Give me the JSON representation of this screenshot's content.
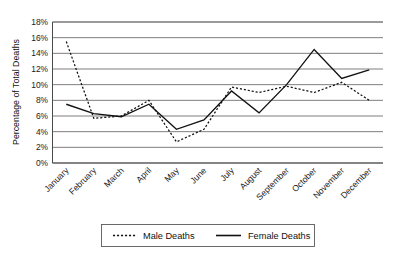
{
  "chart_data": {
    "type": "line",
    "title": "",
    "subtitle": "",
    "xlabel": "",
    "ylabel": "Percentage of Total Deaths",
    "categories": [
      "January",
      "February",
      "March",
      "April",
      "May",
      "June",
      "July",
      "August",
      "September",
      "October",
      "November",
      "December"
    ],
    "series": [
      {
        "name": "Male Deaths",
        "style": "dashed",
        "color": "#111111",
        "values": [
          15.5,
          5.7,
          6.0,
          8.0,
          2.7,
          4.3,
          9.7,
          9.0,
          9.8,
          9.0,
          10.3,
          8.0
        ]
      },
      {
        "name": "Female Deaths",
        "style": "solid",
        "color": "#111111",
        "values": [
          7.5,
          6.3,
          5.9,
          7.5,
          4.3,
          5.5,
          9.2,
          6.4,
          10.0,
          14.5,
          10.8,
          11.9
        ]
      }
    ],
    "ylim": [
      0,
      18
    ],
    "ytick_step": 2,
    "ytick_labels": [
      "0%",
      "2%",
      "4%",
      "6%",
      "8%",
      "10%",
      "12%",
      "14%",
      "16%",
      "18%"
    ],
    "ytick_values": [
      0,
      2,
      4,
      6,
      8,
      10,
      12,
      14,
      16,
      18
    ],
    "grid": "horizontal",
    "legend_position": "bottom",
    "value_suffix": "%"
  },
  "legend": {
    "items": [
      {
        "label": "Male Deaths",
        "style": "dashed"
      },
      {
        "label": "Female Deaths",
        "style": "solid"
      }
    ]
  }
}
